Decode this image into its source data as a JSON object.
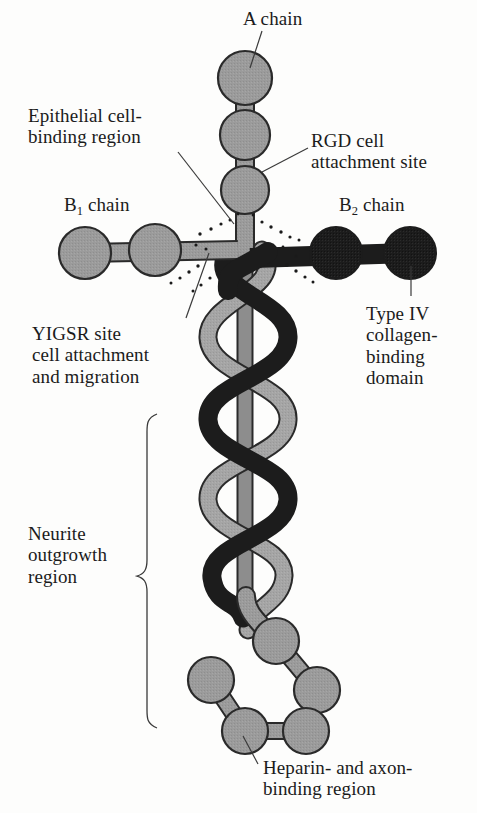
{
  "figure": {
    "type": "molecular-diagram",
    "background_color": "#fdfdfc",
    "text_color": "#1b1b1b"
  },
  "colors": {
    "globule_light": "#9b9b9b",
    "globule_dark": "#1c1c1c",
    "helix_light": "#a5a5a5",
    "helix_mid": "#8d8d8d",
    "helix_dark": "#1c1c1c",
    "outline": "#2a2a2a",
    "leader_line": "#3a3a3a"
  },
  "labels": {
    "a_chain": "A chain",
    "epithelial": "Epithelial cell-\nbinding region",
    "rgd": "RGD cell\nattachment site",
    "b1_chain_prefix": "B",
    "b1_chain_sub": "1",
    "b1_chain_suffix": " chain",
    "b2_chain_prefix": "B",
    "b2_chain_sub": "2",
    "b2_chain_suffix": " chain",
    "type_iv": "Type IV\ncollagen-\nbinding\ndomain",
    "yigsr": "YIGSR site\ncell attachment\nand migration",
    "neurite": "Neurite\noutgrowth\nregion",
    "heparin": "Heparin- and axon-\nbinding region"
  },
  "structure": {
    "a_chain": {
      "label": "A chain",
      "arm": "vertical-top",
      "shade": "light",
      "globule_count": 3,
      "globules": [
        {
          "cx": 245,
          "cy": 78,
          "r": 27
        },
        {
          "cx": 245,
          "cy": 135,
          "r": 25
        },
        {
          "cx": 245,
          "cy": 190,
          "r": 24
        }
      ]
    },
    "b1_chain": {
      "label": "B1 chain",
      "arm": "horizontal-left",
      "shade": "light",
      "globule_count": 2,
      "globules": [
        {
          "cx": 85,
          "cy": 253,
          "r": 26
        },
        {
          "cx": 155,
          "cy": 250,
          "r": 26
        }
      ]
    },
    "b2_chain": {
      "label": "B2 chain",
      "arm": "horizontal-right",
      "shade": "dark",
      "globule_count": 2,
      "globules": [
        {
          "cx": 336,
          "cy": 253,
          "r": 26
        },
        {
          "cx": 410,
          "cy": 253,
          "r": 26
        }
      ]
    },
    "triple_helix": {
      "label": "Neurite outgrowth region",
      "strands": 3,
      "strand_shades": [
        "dark",
        "light",
        "mid-straight"
      ],
      "y_start": 262,
      "y_end": 600,
      "crossover_count": 5
    },
    "heparin_cluster": {
      "label": "Heparin- and axon-binding region",
      "shade": "light",
      "globule_count": 5,
      "globules": [
        {
          "cx": 276,
          "cy": 641,
          "r": 23
        },
        {
          "cx": 317,
          "cy": 690,
          "r": 23
        },
        {
          "cx": 306,
          "cy": 731,
          "r": 23
        },
        {
          "cx": 245,
          "cy": 731,
          "r": 23
        },
        {
          "cx": 211,
          "cy": 680,
          "r": 23
        }
      ]
    },
    "junction": {
      "label": "cross-junction with stipple",
      "x": 245,
      "y": 250,
      "stipple_dot_count": 26
    }
  }
}
